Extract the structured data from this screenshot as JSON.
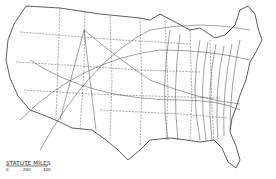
{
  "map": {
    "subject": "United States isoline map",
    "scale": {
      "title": "STATUTE MILES",
      "ticks": [
        "0",
        "200",
        "400"
      ]
    },
    "colors": {
      "ink": "#333333",
      "background": "#ffffff"
    }
  }
}
